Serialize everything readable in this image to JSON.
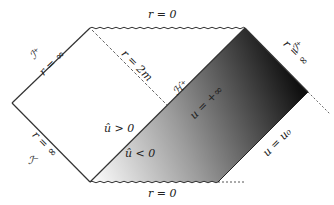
{
  "diagram": {
    "type": "penrose-diagram",
    "labels": {
      "top_singularity": "r = 0",
      "bottom_singularity": "r = 0",
      "scri_plus_left": "ℐ⁺",
      "r_inf_left_top": "r = ∞",
      "scri_minus_left": "ℐ⁻",
      "r_inf_left_bottom": "r = ∞",
      "scri_plus_right": "ℐ⁺",
      "r_inf_right": "r = ∞",
      "horizon": "r = 2m",
      "event_horizon": "ℋ⁺",
      "u_plus_inf": "u = +∞",
      "u_zero": "u = u₀",
      "uhat_pos": "û > 0",
      "uhat_neg": "û < 0"
    },
    "colors": {
      "line": "#333333",
      "shade_light": "#ffffff",
      "shade_dark": "#111111"
    }
  }
}
